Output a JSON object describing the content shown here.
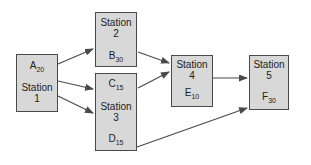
{
  "diagram": {
    "type": "process-flow",
    "stations": [
      {
        "label": "Station",
        "number": "1",
        "top_task": {
          "letter": "A",
          "sub": "20"
        }
      },
      {
        "label": "Station",
        "number": "2",
        "bottom_task": {
          "letter": "B",
          "sub": "30"
        }
      },
      {
        "label": "Station",
        "number": "3",
        "top_task": {
          "letter": "C",
          "sub": "15"
        },
        "bottom_task": {
          "letter": "D",
          "sub": "15"
        }
      },
      {
        "label": "Station",
        "number": "4",
        "bottom_task": {
          "letter": "E",
          "sub": "10"
        }
      },
      {
        "label": "Station",
        "number": "5",
        "bottom_task": {
          "letter": "F",
          "sub": "30"
        }
      }
    ],
    "edges": [
      {
        "from": "Station 1",
        "to": "Station 2"
      },
      {
        "from": "Station 1",
        "to": "Station 3 (task C)"
      },
      {
        "from": "Station 1",
        "to": "Station 3"
      },
      {
        "from": "Station 2",
        "to": "Station 4"
      },
      {
        "from": "Station 3 (task C)",
        "to": "Station 4"
      },
      {
        "from": "Station 4",
        "to": "Station 5"
      },
      {
        "from": "Station 3 (task D)",
        "to": "Station 5"
      }
    ],
    "colors": {
      "background": "#ffffff",
      "box_fill": "#d8d8d8",
      "box_border": "#4a4a4a",
      "arrow": "#4a4a4a",
      "text": "#222222"
    }
  }
}
